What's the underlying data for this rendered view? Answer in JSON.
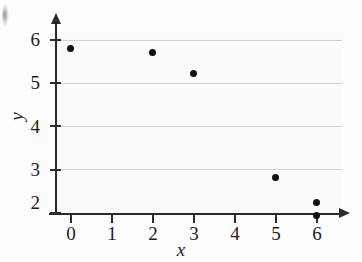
{
  "chart_data": {
    "type": "scatter",
    "title": "",
    "xlabel": "x",
    "ylabel": "y",
    "xlim": [
      -0.35,
      6.6
    ],
    "ylim": [
      1.6,
      6.35
    ],
    "grid": true,
    "legend": null,
    "x_ticks": [
      "0",
      "1",
      "2",
      "3",
      "4",
      "5",
      "6"
    ],
    "x_tick_values": [
      0,
      1,
      2,
      3,
      4,
      5,
      6
    ],
    "y_ticks": [
      "2",
      "3",
      "4",
      "5",
      "6"
    ],
    "y_tick_values": [
      2,
      3,
      4,
      5,
      6
    ],
    "gridlines_y": [
      2,
      3,
      4,
      5,
      6
    ],
    "marker": "filled-circle",
    "marker_color": "#101010",
    "points": [
      {
        "x": 0,
        "y": 5.8
      },
      {
        "x": 2,
        "y": 5.7
      },
      {
        "x": 3,
        "y": 5.22
      },
      {
        "x": 5,
        "y": 2.82
      },
      {
        "x": 6,
        "y": 2.25
      },
      {
        "x": 6,
        "y": 1.93
      }
    ],
    "x": [
      0,
      2,
      3,
      5,
      6,
      6
    ],
    "y": [
      5.8,
      5.7,
      5.22,
      2.82,
      2.25,
      1.93
    ]
  },
  "axes": {
    "x_axis_label": "x",
    "y_axis_label": "y",
    "x_arrow": "arrow-right",
    "y_arrow": "arrow-up"
  },
  "colors": {
    "background": "#fdfdfd",
    "panel": "#fbfbfb",
    "gridline": "#d2d2d2",
    "axis": "#2b2b2b",
    "text": "#1c1c1c",
    "marker": "#101010"
  }
}
